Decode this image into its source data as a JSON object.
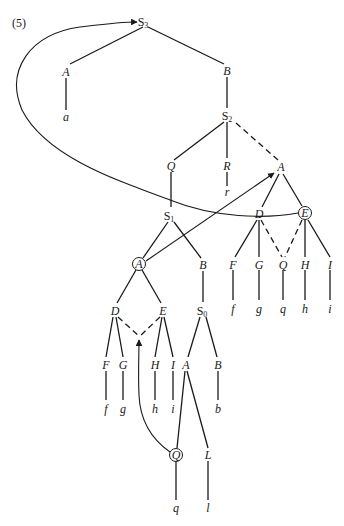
{
  "figure": {
    "label": "(5)"
  },
  "nodes": {
    "S3": {
      "label": "S",
      "sub": "3"
    },
    "A_top": {
      "label": "A"
    },
    "a_top": {
      "label": "a"
    },
    "B_top": {
      "label": "B"
    },
    "S2": {
      "label": "S",
      "sub": "2"
    },
    "Q_mid": {
      "label": "Q"
    },
    "R": {
      "label": "R"
    },
    "r": {
      "label": "r"
    },
    "A_right": {
      "label": "A"
    },
    "S1": {
      "label": "S",
      "sub": "1"
    },
    "A_circ": {
      "label": "A"
    },
    "B_mid": {
      "label": "B"
    },
    "D_right": {
      "label": "D"
    },
    "E_circ": {
      "label": "E"
    },
    "F_right": {
      "label": "F"
    },
    "G_right": {
      "label": "G"
    },
    "Q_right": {
      "label": "Q"
    },
    "H_right": {
      "label": "H"
    },
    "I_right": {
      "label": "I"
    },
    "f_right": {
      "label": "f"
    },
    "g_right": {
      "label": "g"
    },
    "q_right": {
      "label": "q"
    },
    "h_right": {
      "label": "h"
    },
    "i_right": {
      "label": "i"
    },
    "D_left": {
      "label": "D"
    },
    "E_left": {
      "label": "E"
    },
    "S0": {
      "label": "S",
      "sub": "0"
    },
    "F_left": {
      "label": "F"
    },
    "G_left": {
      "label": "G"
    },
    "H_left": {
      "label": "H"
    },
    "I_left": {
      "label": "I"
    },
    "A_low": {
      "label": "A"
    },
    "B_low": {
      "label": "B"
    },
    "f_left": {
      "label": "f"
    },
    "g_left": {
      "label": "g"
    },
    "h_left": {
      "label": "h"
    },
    "i_left": {
      "label": "i"
    },
    "b_low": {
      "label": "b"
    },
    "Q_circ": {
      "label": "Q"
    },
    "L": {
      "label": "L"
    },
    "q_low": {
      "label": "q"
    },
    "l_low": {
      "label": "l"
    }
  },
  "arrows": [
    {
      "from": "E_circ",
      "to": "S3",
      "type": "curved-movement"
    },
    {
      "from": "A_circ",
      "to": "A_right",
      "type": "movement"
    },
    {
      "from": "Q_circ",
      "to": "D_left/E_left junction",
      "type": "curved-movement"
    }
  ]
}
